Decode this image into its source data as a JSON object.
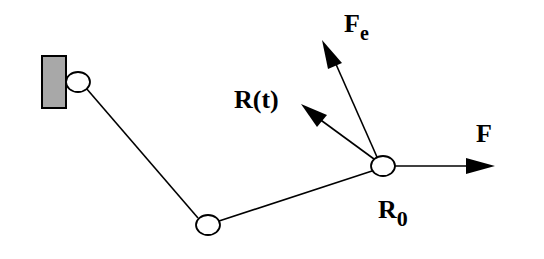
{
  "diagram": {
    "type": "linkage-force-diagram",
    "wall": {
      "x": 42,
      "y": 56,
      "width": 24,
      "height": 52,
      "fill": "#a8a8a8"
    },
    "joints": [
      {
        "id": "anchor",
        "cx": 78,
        "cy": 82
      },
      {
        "id": "elbow",
        "cx": 208,
        "cy": 225
      },
      {
        "id": "end",
        "cx": 383,
        "cy": 166,
        "label": "R",
        "subscript": "0"
      }
    ],
    "links": [
      {
        "from": "anchor",
        "to": "elbow"
      },
      {
        "from": "elbow",
        "to": "end"
      }
    ],
    "arrows": [
      {
        "name": "F",
        "label": "F",
        "from": [
          383,
          166
        ],
        "to": [
          495,
          166
        ]
      },
      {
        "name": "Fe",
        "label": "F",
        "subscript": "e",
        "from": [
          383,
          166
        ],
        "to": [
          325,
          40
        ]
      },
      {
        "name": "R(t)",
        "label": "R(t)",
        "from": [
          383,
          166
        ],
        "to": [
          303,
          108
        ]
      }
    ],
    "labels": {
      "fe_main": "F",
      "fe_sub": "e",
      "rt": "R(t)",
      "f": "F",
      "r0_main": "R",
      "r0_sub": "0"
    },
    "colors": {
      "stroke": "#000000",
      "wall_fill": "#a8a8a8",
      "background": "#ffffff"
    }
  }
}
